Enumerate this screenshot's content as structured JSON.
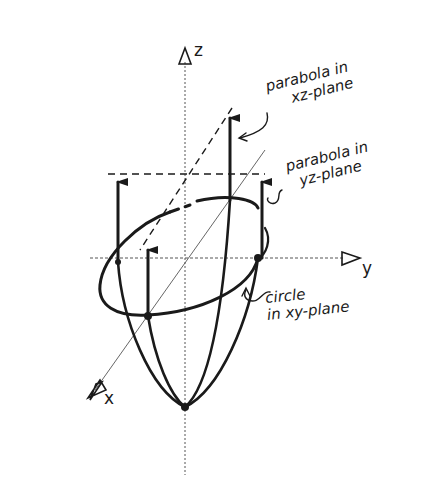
{
  "diagram": {
    "type": "hand-drawn 3D sketch",
    "axes": {
      "z": {
        "label": "z"
      },
      "y": {
        "label": "y"
      },
      "x": {
        "label": "x"
      }
    },
    "annotations": {
      "xz_parabola": {
        "line1": "parabola in",
        "line2": "xz-plane"
      },
      "yz_parabola": {
        "line1": "parabola in",
        "line2": "yz-plane"
      },
      "xy_circle": {
        "line1": "circle",
        "line2": "in xy-plane"
      }
    },
    "colors": {
      "ink": "#1a1a1a",
      "background": "#ffffff",
      "guide": "#555555"
    }
  }
}
